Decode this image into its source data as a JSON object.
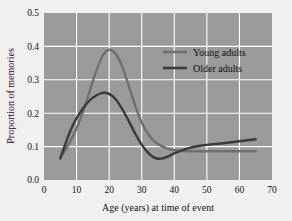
{
  "chart_data": {
    "type": "line",
    "title": "",
    "xlabel": "Age (years) at time of event",
    "ylabel": "Proportion of memories",
    "xlim": [
      0,
      70
    ],
    "ylim": [
      0.0,
      0.5
    ],
    "xticks": [
      "0",
      "10",
      "20",
      "30",
      "40",
      "50",
      "60",
      "70"
    ],
    "xtick_values": [
      0,
      10,
      20,
      30,
      40,
      50,
      60,
      70
    ],
    "yticks": [
      "0.0",
      "0.1",
      "0.2",
      "0.3",
      "0.4",
      "0.5"
    ],
    "ytick_values": [
      0.0,
      0.1,
      0.2,
      0.3,
      0.4,
      0.5
    ],
    "grid": true,
    "grid_color": "#ffffff",
    "plot_background": "#9a9a9a",
    "figure_background": "#f2f0ee",
    "legend_position": "upper-right",
    "x": [
      5,
      8,
      10,
      12,
      14,
      16,
      18,
      20,
      22,
      24,
      26,
      28,
      30,
      32,
      34,
      36,
      38,
      40,
      45,
      50,
      55,
      60,
      65
    ],
    "series": [
      {
        "name": "Young adults",
        "color": "#6f6f6f",
        "values": [
          0.065,
          0.115,
          0.155,
          0.205,
          0.265,
          0.325,
          0.372,
          0.39,
          0.378,
          0.34,
          0.283,
          0.222,
          0.172,
          0.137,
          0.115,
          0.102,
          0.094,
          0.089,
          0.086,
          0.086,
          0.086,
          0.086,
          0.086
        ]
      },
      {
        "name": "Older adults",
        "color": "#3a3a3a",
        "values": [
          0.065,
          0.145,
          0.185,
          0.215,
          0.238,
          0.253,
          0.261,
          0.258,
          0.242,
          0.213,
          0.177,
          0.139,
          0.106,
          0.081,
          0.066,
          0.064,
          0.07,
          0.08,
          0.097,
          0.105,
          0.11,
          0.116,
          0.122
        ]
      }
    ]
  },
  "legend": {
    "entries": [
      {
        "label": "Young adults",
        "color": "#6f6f6f"
      },
      {
        "label": "Older adults",
        "color": "#3a3a3a"
      }
    ]
  },
  "axes": {
    "x_title": "Age (years) at time of event",
    "y_title": "Proportion of memories"
  }
}
